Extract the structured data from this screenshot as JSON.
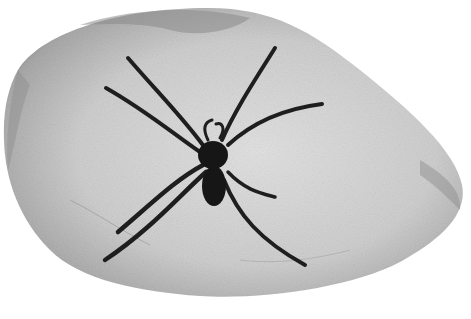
{
  "image": {
    "subject": "spider fossil in stone",
    "style": "grayscale photograph",
    "colors": {
      "background": "#ffffff",
      "stone_light": "#d8d8d8",
      "stone_mid": "#bcbcbc",
      "stone_edge": "#7a7a7a",
      "spider": "#1a1a1a"
    }
  }
}
